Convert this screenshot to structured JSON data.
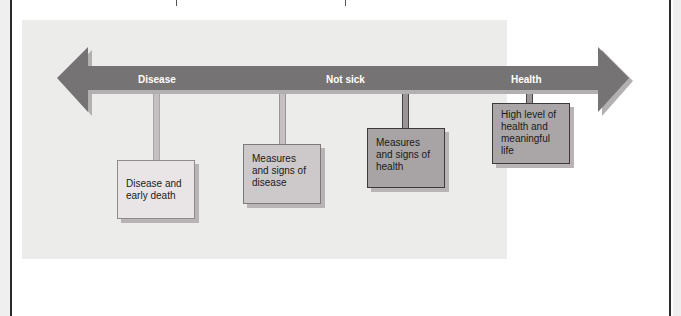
{
  "diagram": {
    "type": "continuum",
    "arrow": {
      "color": "#767374",
      "shadow_color": "#b3b0b1",
      "labels": [
        {
          "id": "disease",
          "text": "Disease"
        },
        {
          "id": "not_sick",
          "text": "Not sick"
        },
        {
          "id": "health",
          "text": "Health"
        }
      ]
    },
    "boxes": [
      {
        "id": "disease_early_death",
        "text": "Disease and\nearly death",
        "fill": "#e9e5e7"
      },
      {
        "id": "measures_disease",
        "text": "Measures\nand signs of\ndisease",
        "fill": "#cdc8ca"
      },
      {
        "id": "measures_health",
        "text": "Measures\nand signs of\nhealth",
        "fill": "#a8a3a5"
      },
      {
        "id": "high_level_health",
        "text": "High level of\nhealth and\nmeaningful\nlife",
        "fill": "#aaa5a7"
      }
    ],
    "panel_color": "#ececeb"
  }
}
